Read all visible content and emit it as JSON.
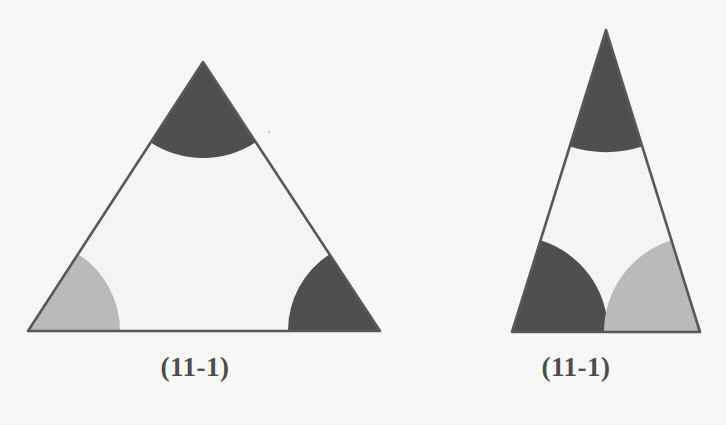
{
  "document": {
    "kind": "scanned-geometry-figure",
    "background_color": "#fdfdfd",
    "ink_color": "#4f4f4f"
  },
  "palette": {
    "dark_fill": "#4f4f4f",
    "light_fill": "#c2c2c2",
    "outline": "#595959",
    "paper": "#fdfdfd"
  },
  "figures": [
    {
      "id": "figure-left",
      "caption": "(11-1)",
      "shape": "equilateral-triangle",
      "outline_color": "#595959",
      "outline_width": 2.6,
      "vertices": [
        {
          "name": "apex",
          "x": 203,
          "y": 62
        },
        {
          "name": "bottom-left",
          "x": 28,
          "y": 331
        },
        {
          "name": "bottom-right",
          "x": 380,
          "y": 331
        }
      ],
      "sectors": [
        {
          "at": "apex",
          "fill": "dark",
          "color": "#4f4f4f",
          "radius": 96
        },
        {
          "at": "bottom-left",
          "fill": "light",
          "color": "#c2c2c2",
          "radius": 92
        },
        {
          "at": "bottom-right",
          "fill": "dark",
          "color": "#4f4f4f",
          "radius": 92
        }
      ]
    },
    {
      "id": "figure-right",
      "caption": "(11-1)",
      "shape": "narrow-isosceles-triangle",
      "outline_color": "#595959",
      "outline_width": 2.6,
      "vertices": [
        {
          "name": "apex",
          "x": 606,
          "y": 30
        },
        {
          "name": "bottom-left",
          "x": 512,
          "y": 332
        },
        {
          "name": "bottom-right",
          "x": 700,
          "y": 332
        }
      ],
      "sectors": [
        {
          "at": "apex",
          "fill": "dark",
          "color": "#4f4f4f",
          "radius": 122
        },
        {
          "at": "bottom-left",
          "fill": "dark",
          "color": "#4f4f4f",
          "radius": 96
        },
        {
          "at": "bottom-right",
          "fill": "light",
          "color": "#c2c2c2",
          "radius": 96
        }
      ]
    }
  ]
}
